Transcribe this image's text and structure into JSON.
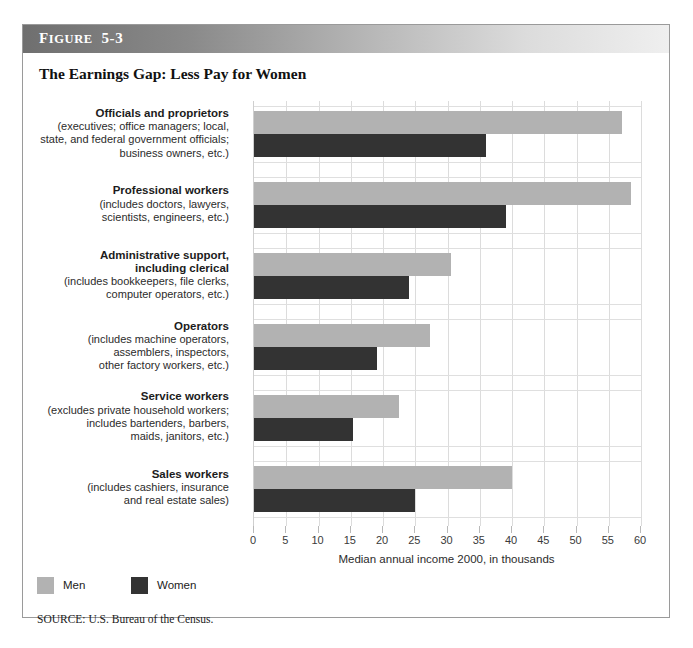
{
  "figure": {
    "banner_label_first": "F",
    "banner_label_rest": "IGURE",
    "banner_number": "5-3",
    "title": "The Earnings Gap: Less Pay for Women",
    "source": "SOURCE: U.S. Bureau of the Census."
  },
  "legend": {
    "men_label": "Men",
    "women_label": "Women",
    "men_color": "#b2b2b2",
    "women_color": "#333333"
  },
  "chart_data": {
    "type": "bar",
    "orientation": "horizontal",
    "title": "The Earnings Gap: Less Pay for Women",
    "subtitle": "FIGURE 5-3",
    "xlabel": "Median annual income 2000, in thousands",
    "ylabel": "",
    "xlim": [
      0,
      60
    ],
    "xticks": [
      0,
      5,
      10,
      15,
      20,
      25,
      30,
      35,
      40,
      45,
      50,
      55,
      60
    ],
    "xtick_labels": [
      "0",
      "5",
      "10",
      "15",
      "20",
      "25",
      "30",
      "35",
      "40",
      "45",
      "50",
      "55",
      "60"
    ],
    "grid": true,
    "grid_axis": "x",
    "legend_position": "bottom-left",
    "source": "SOURCE: U.S. Bureau of the Census.",
    "categories": [
      "Officials and proprietors",
      "Professional workers",
      "Administrative support, including clerical",
      "Operators",
      "Service workers",
      "Sales workers"
    ],
    "series": [
      {
        "name": "Men",
        "color": "#b2b2b2",
        "values": [
          57,
          58.5,
          30.5,
          27.3,
          22.5,
          40
        ]
      },
      {
        "name": "Women",
        "color": "#333333",
        "values": [
          36,
          39,
          24,
          19,
          15.3,
          25
        ]
      }
    ]
  },
  "categories": [
    {
      "name": "Officials and proprietors",
      "desc_lines": [
        "(executives; office managers; local,",
        "state, and federal government officials;",
        "business owners, etc.)"
      ],
      "men": 57,
      "women": 36
    },
    {
      "name": "Professional workers",
      "desc_lines": [
        "(includes doctors, lawyers,",
        "scientists, engineers, etc.)"
      ],
      "men": 58.5,
      "women": 39
    },
    {
      "name": "Administrative support,\nincluding clerical",
      "name_lines": [
        "Administrative support,",
        "including clerical"
      ],
      "desc_lines": [
        "(includes bookkeepers, file clerks,",
        "computer operators, etc.)"
      ],
      "men": 30.5,
      "women": 24
    },
    {
      "name": "Operators",
      "desc_lines": [
        "(includes machine operators,",
        "assemblers, inspectors,",
        "other factory workers, etc.)"
      ],
      "men": 27.3,
      "women": 19
    },
    {
      "name": "Service workers",
      "desc_lines": [
        "(excludes private household workers;",
        "includes bartenders, barbers,",
        "maids, janitors, etc.)"
      ],
      "men": 22.5,
      "women": 15.3
    },
    {
      "name": "Sales workers",
      "desc_lines": [
        "(includes cashiers, insurance",
        "and real estate sales)"
      ],
      "men": 40,
      "women": 25
    }
  ]
}
